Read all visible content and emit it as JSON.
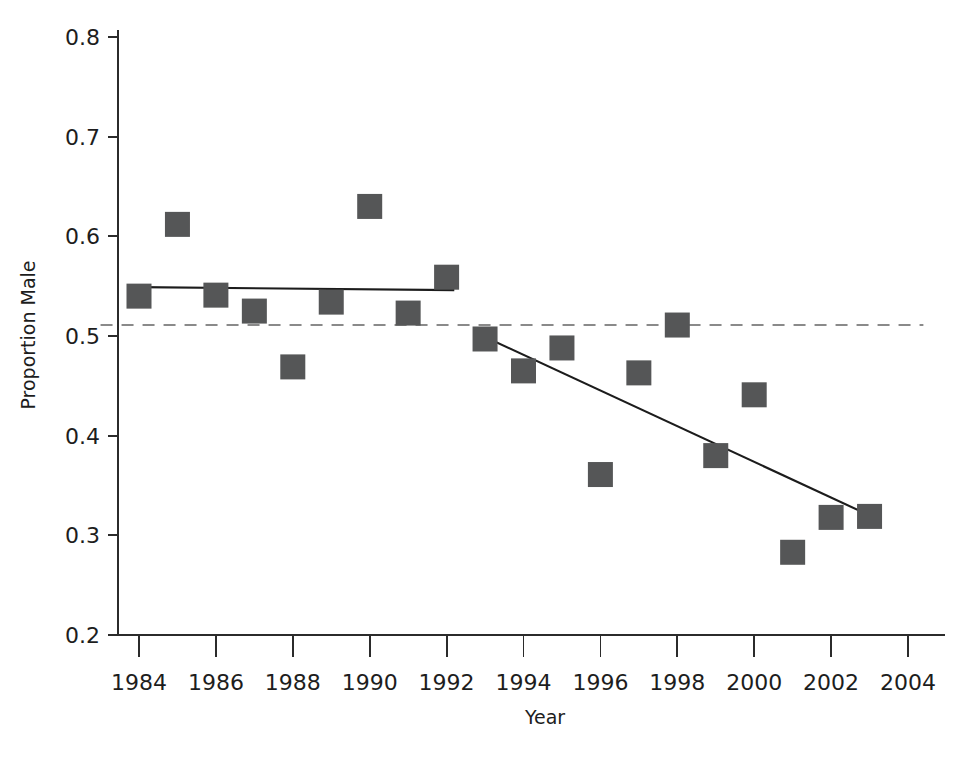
{
  "chart_data": {
    "type": "scatter",
    "title": "",
    "xlabel": "Year",
    "ylabel": "Proportion Male",
    "xlim": [
      1983,
      2004.5
    ],
    "ylim": [
      0.2,
      0.8
    ],
    "grid": false,
    "legend": "none",
    "x_ticks": [
      1984,
      1986,
      1988,
      1990,
      1992,
      1994,
      1996,
      1998,
      2000,
      2002,
      2004
    ],
    "x_tick_labels": [
      "1984",
      "1986",
      "1988",
      "1990",
      "1992",
      "1994",
      "1996",
      "1998",
      "2000",
      "2002",
      "2004"
    ],
    "x_minor_ticks": [
      1985,
      1987,
      1989,
      1991,
      1993,
      1995,
      1997,
      1999,
      2001,
      2003
    ],
    "y_ticks": [
      0.2,
      0.3,
      0.4,
      0.5,
      0.6,
      0.7,
      0.8
    ],
    "y_tick_labels": [
      "0.2",
      "0.3",
      "0.4",
      "0.5",
      "0.6",
      "0.7",
      "0.8"
    ],
    "marker_shape": "square",
    "marker_color": "#555657",
    "x": [
      1984,
      1985,
      1986,
      1987,
      1988,
      1989,
      1990,
      1991,
      1992,
      1993,
      1994,
      1995,
      1996,
      1997,
      1998,
      1999,
      2000,
      2001,
      2002,
      2003
    ],
    "values": [
      0.54,
      0.612,
      0.541,
      0.525,
      0.469,
      0.534,
      0.63,
      0.523,
      0.559,
      0.497,
      0.465,
      0.488,
      0.361,
      0.463,
      0.511,
      0.38,
      0.441,
      0.283,
      0.318,
      0.319
    ],
    "series": [
      {
        "name": "Proportion Male",
        "x": [
          1984,
          1985,
          1986,
          1987,
          1988,
          1989,
          1990,
          1991,
          1992,
          1993,
          1994,
          1995,
          1996,
          1997,
          1998,
          1999,
          2000,
          2001,
          2002,
          2003
        ],
        "values": [
          0.54,
          0.612,
          0.541,
          0.525,
          0.469,
          0.534,
          0.63,
          0.523,
          0.559,
          0.497,
          0.465,
          0.488,
          0.361,
          0.463,
          0.511,
          0.38,
          0.441,
          0.283,
          0.318,
          0.319
        ]
      }
    ],
    "annotations": [
      {
        "name": "flat-trend-segment",
        "type": "line",
        "style": "solid",
        "color": "#1c1c1c",
        "x": [
          1984.0,
          1992.2
        ],
        "y": [
          0.549,
          0.546
        ]
      },
      {
        "name": "declining-trend-segment",
        "type": "line",
        "style": "solid",
        "color": "#1c1c1c",
        "x": [
          1993.0,
          2003.0
        ],
        "y": [
          0.499,
          0.32
        ]
      },
      {
        "name": "reference-line-parity",
        "type": "hline",
        "style": "dashed",
        "color": "#8a8a8a",
        "y": 0.511,
        "x": [
          1983.0,
          2004.4
        ]
      }
    ]
  }
}
